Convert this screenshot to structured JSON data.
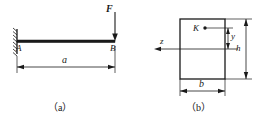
{
  "figure": {
    "type": "engineering-mechanics-diagram",
    "line_color": "#1a1a1a",
    "background_color": "#ffffff"
  },
  "panel_a": {
    "caption": "（a）",
    "support_label": "A",
    "free_end_label": "B",
    "force_label": "F",
    "force_direction": "downward",
    "span_label": "a",
    "support_type": "fixed-wall-hatched",
    "beam_geometry": {
      "x_start": 17,
      "x_end": 115,
      "y": 41,
      "thickness": 3
    },
    "dimension_line": {
      "label": "a",
      "x_start": 17,
      "x_end": 115,
      "y": 67
    }
  },
  "panel_b": {
    "caption": "（b）",
    "section_shape": "rectangle",
    "point_label": "K",
    "axis_label_z": "z",
    "dim_y_label": "y",
    "dim_h_label": "h",
    "dim_b_label": "b",
    "rect": {
      "x": 180,
      "y": 19,
      "width": 45,
      "height": 60
    },
    "point_K": {
      "x": 205,
      "y": 28
    },
    "neutral_axis_y": 49
  }
}
